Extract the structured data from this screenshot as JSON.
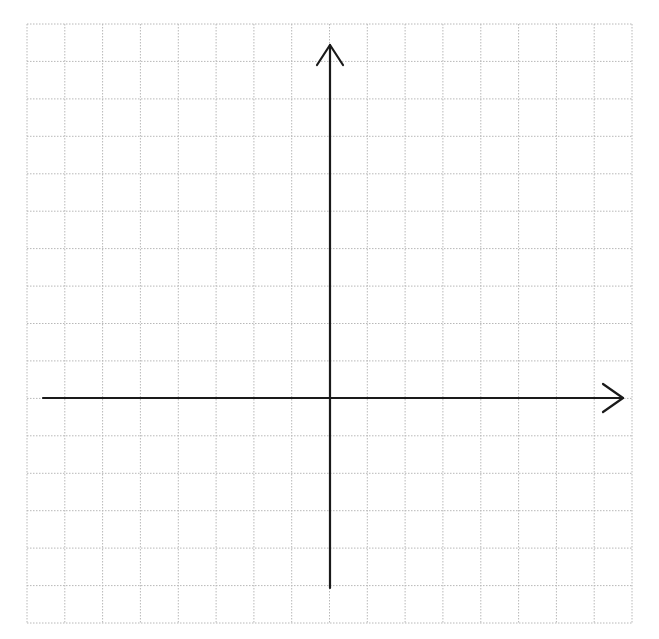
{
  "diagram": {
    "type": "cartesian-coordinate-grid",
    "canvas": {
      "width": 659,
      "height": 639,
      "background": "#ffffff"
    },
    "grid": {
      "left": 27,
      "top": 24,
      "right": 632,
      "bottom": 623,
      "columns": 16,
      "rows": 16,
      "line_color": "#b8b8b8",
      "line_style": "dotted"
    },
    "axes": {
      "color": "#1a1a1a",
      "width": 2.2,
      "x_axis": {
        "y": 398,
        "x_start": 43,
        "x_end": 623,
        "arrow": "right"
      },
      "y_axis": {
        "x": 330,
        "y_start": 588,
        "y_end": 45,
        "arrow": "up"
      },
      "labels": []
    }
  }
}
